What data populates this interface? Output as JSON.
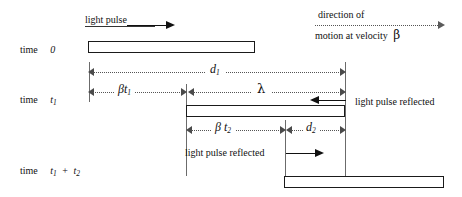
{
  "figure": {
    "type": "spacetime-diagram"
  },
  "captions": {
    "light_pulse": "light pulse",
    "direction_of": "direction of",
    "motion_at_velocity": "motion at velocity",
    "beta_symbol": "β",
    "light_pulse_reflected_right": "light pulse reflected",
    "light_pulse_reflected_bottom": "light pulse reflected"
  },
  "time_labels": [
    {
      "id": "t0",
      "word": "time",
      "value": "0"
    },
    {
      "id": "t1",
      "word": "time",
      "value": "t",
      "sub": "1"
    },
    {
      "id": "t1plust2",
      "word": "time",
      "value": "t",
      "sub": "1",
      "op": "+",
      "value2": "t",
      "sub2": "2"
    }
  ],
  "measures": [
    {
      "id": "d1",
      "symbol": "d",
      "sub": "1"
    },
    {
      "id": "bt1",
      "symbol": "βt",
      "sub": "1"
    },
    {
      "id": "lam",
      "symbol": "λ",
      "sub": ""
    },
    {
      "id": "bt2",
      "symbol": "β t",
      "sub": "2"
    },
    {
      "id": "d2",
      "symbol": "d",
      "sub": "2"
    }
  ],
  "rods": [
    {
      "id": "rod-time-0",
      "label": "rod at time 0"
    },
    {
      "id": "rod-time-t1",
      "label": "rod at time t1"
    },
    {
      "id": "rod-time-t1-t2",
      "label": "rod at time t1 + t2"
    }
  ],
  "colors": {
    "ink": "#111111",
    "rule": "#555555",
    "background": "#ffffff"
  }
}
